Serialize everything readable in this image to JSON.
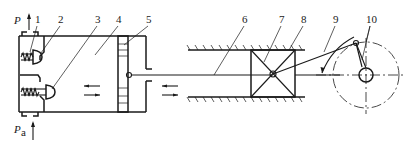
{
  "figure": {
    "pressure_labels": {
      "discharge": "P",
      "suction_main": "P",
      "suction_sub": "a"
    },
    "callouts": [
      {
        "id": "1",
        "label": "1"
      },
      {
        "id": "2",
        "label": "2"
      },
      {
        "id": "3",
        "label": "3"
      },
      {
        "id": "4",
        "label": "4"
      },
      {
        "id": "5",
        "label": "5"
      },
      {
        "id": "6",
        "label": "6"
      },
      {
        "id": "7",
        "label": "7"
      },
      {
        "id": "8",
        "label": "8"
      },
      {
        "id": "9",
        "label": "9"
      },
      {
        "id": "10",
        "label": "10"
      }
    ],
    "components": {
      "discharge_valve": "1",
      "valve_head_upper": "2",
      "suction_valve": "3",
      "cylinder": "4",
      "piston": "5",
      "piston_rod": "6",
      "crosshead_guide": "7",
      "crosshead": "8",
      "connecting_rod": "9",
      "crankshaft": "10"
    },
    "colors": {
      "ink": "#1a1a1a",
      "background": "#ffffff"
    }
  }
}
